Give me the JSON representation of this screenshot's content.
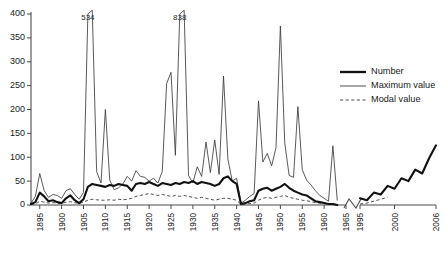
{
  "chart_data": {
    "type": "line",
    "title": "",
    "xlabel": "",
    "ylabel": "",
    "ylim": [
      0,
      400
    ],
    "grid": false,
    "legend_position": "right",
    "axis_break": {
      "after": 1965,
      "before": 1995,
      "label": "axis-break"
    },
    "y_ticks": [
      0,
      50,
      100,
      150,
      200,
      250,
      300,
      350,
      400
    ],
    "x_ticks": [
      1895,
      1900,
      1905,
      1910,
      1915,
      1920,
      1925,
      1930,
      1935,
      1940,
      1945,
      1950,
      1955,
      1960,
      1965,
      1995,
      2000,
      2006
    ],
    "annotations": [
      {
        "text": "534",
        "year": 1906,
        "note": "off-scale peak of Maximum value"
      },
      {
        "text": "838",
        "year": 1927,
        "note": "off-scale peak of Maximum value"
      }
    ],
    "series": [
      {
        "name": "Number",
        "style": "thick-solid",
        "color": "#111111",
        "x": [
          1893,
          1894,
          1895,
          1896,
          1897,
          1898,
          1899,
          1900,
          1901,
          1902,
          1903,
          1904,
          1905,
          1906,
          1907,
          1908,
          1909,
          1910,
          1911,
          1912,
          1913,
          1914,
          1915,
          1916,
          1917,
          1918,
          1919,
          1920,
          1921,
          1922,
          1923,
          1924,
          1925,
          1926,
          1927,
          1928,
          1929,
          1930,
          1931,
          1932,
          1933,
          1934,
          1935,
          1936,
          1937,
          1938,
          1939,
          1940,
          1941,
          1942,
          1943,
          1944,
          1945,
          1946,
          1947,
          1948,
          1949,
          1950,
          1951,
          1952,
          1953,
          1954,
          1955,
          1956,
          1957,
          1958,
          1959,
          1960,
          1961,
          1962,
          1963
        ],
        "values": [
          2,
          6,
          26,
          18,
          8,
          10,
          6,
          4,
          14,
          20,
          10,
          4,
          12,
          38,
          44,
          42,
          40,
          38,
          42,
          40,
          44,
          42,
          40,
          30,
          44,
          46,
          44,
          48,
          44,
          40,
          46,
          44,
          42,
          46,
          44,
          48,
          46,
          50,
          44,
          48,
          46,
          44,
          40,
          44,
          56,
          60,
          50,
          44,
          2,
          4,
          8,
          10,
          30,
          34,
          36,
          30,
          34,
          38,
          44,
          36,
          30,
          26,
          22,
          20,
          14,
          8,
          6,
          4,
          2,
          2,
          0
        ]
      },
      {
        "name": "Number (recent)",
        "style": "thick-solid",
        "color": "#111111",
        "segment": "right",
        "x": [
          1995,
          1996,
          1997,
          1998,
          1999,
          2000,
          2001,
          2002,
          2003,
          2004,
          2005,
          2006
        ],
        "values": [
          14,
          10,
          26,
          22,
          40,
          34,
          56,
          50,
          74,
          66,
          98,
          125
        ]
      },
      {
        "name": "Maximum value",
        "style": "thin-solid",
        "color": "#3c3c3c",
        "x": [
          1893,
          1894,
          1895,
          1896,
          1897,
          1898,
          1899,
          1900,
          1901,
          1902,
          1903,
          1904,
          1905,
          1906,
          1907,
          1908,
          1909,
          1910,
          1911,
          1912,
          1913,
          1914,
          1915,
          1916,
          1917,
          1918,
          1919,
          1920,
          1921,
          1922,
          1923,
          1924,
          1925,
          1926,
          1927,
          1928,
          1929,
          1930,
          1931,
          1932,
          1933,
          1934,
          1935,
          1936,
          1937,
          1938,
          1939,
          1940,
          1941,
          1942,
          1943,
          1944,
          1945,
          1946,
          1947,
          1948,
          1949,
          1950,
          1951,
          1952,
          1953,
          1954,
          1955,
          1956,
          1957,
          1958,
          1959,
          1960,
          1961,
          1962,
          1963
        ],
        "values": [
          4,
          18,
          66,
          30,
          16,
          22,
          20,
          14,
          30,
          34,
          22,
          12,
          26,
          400,
          534,
          70,
          46,
          200,
          52,
          32,
          36,
          44,
          60,
          50,
          72,
          60,
          58,
          50,
          56,
          46,
          70,
          254,
          278,
          104,
          400,
          838,
          62,
          46,
          80,
          60,
          132,
          68,
          136,
          64,
          270,
          96,
          50,
          56,
          4,
          10,
          18,
          24,
          218,
          90,
          108,
          82,
          120,
          375,
          130,
          62,
          58,
          206,
          74,
          52,
          42,
          30,
          20,
          14,
          8,
          124,
          10
        ]
      },
      {
        "name": "Modal value",
        "style": "dashed",
        "color": "#3c3c3c",
        "x": [
          1893,
          1894,
          1895,
          1896,
          1897,
          1898,
          1899,
          1900,
          1901,
          1902,
          1903,
          1904,
          1905,
          1906,
          1907,
          1908,
          1909,
          1910,
          1911,
          1912,
          1913,
          1914,
          1915,
          1916,
          1917,
          1918,
          1919,
          1920,
          1921,
          1922,
          1923,
          1924,
          1925,
          1926,
          1927,
          1928,
          1929,
          1930,
          1931,
          1932,
          1933,
          1934,
          1935,
          1936,
          1937,
          1938,
          1939,
          1940,
          1941,
          1942,
          1943,
          1944,
          1945,
          1946,
          1947,
          1948,
          1949,
          1950,
          1951,
          1952,
          1953,
          1954,
          1955,
          1956,
          1957,
          1958,
          1959,
          1960,
          1961,
          1962,
          1963
        ],
        "values": [
          1,
          2,
          8,
          6,
          4,
          5,
          4,
          3,
          6,
          7,
          5,
          3,
          6,
          10,
          12,
          11,
          10,
          10,
          11,
          10,
          12,
          11,
          12,
          14,
          18,
          20,
          22,
          24,
          22,
          20,
          22,
          20,
          18,
          20,
          18,
          20,
          18,
          16,
          14,
          16,
          14,
          12,
          10,
          12,
          14,
          14,
          12,
          10,
          1,
          2,
          3,
          4,
          10,
          14,
          16,
          14,
          16,
          18,
          20,
          16,
          14,
          12,
          10,
          9,
          7,
          5,
          4,
          3,
          2,
          2,
          1
        ]
      },
      {
        "name": "Modal value (recent)",
        "style": "dashed",
        "color": "#3c3c3c",
        "segment": "right",
        "x": [
          1995,
          1996,
          1997,
          1998,
          1999
        ],
        "values": [
          2,
          4,
          8,
          12,
          16
        ]
      }
    ]
  },
  "legend": {
    "entries": [
      {
        "label": "Number",
        "style": "thick-solid"
      },
      {
        "label": "Maximum value",
        "style": "thin-solid"
      },
      {
        "label": "Modal value",
        "style": "dashed"
      }
    ]
  }
}
